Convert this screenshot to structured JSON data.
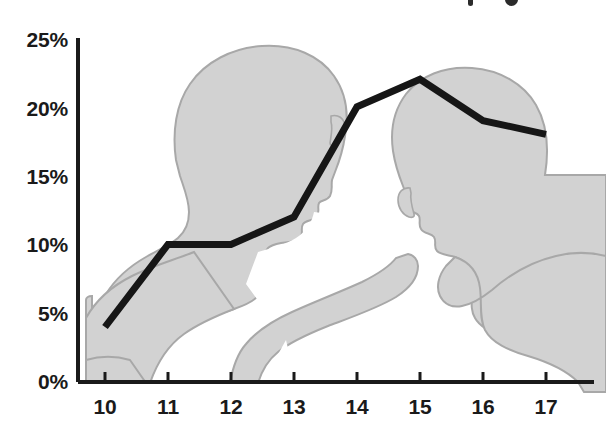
{
  "chart_data": {
    "type": "line",
    "title": "",
    "xlabel": "",
    "ylabel": "",
    "x": [
      10,
      11,
      12,
      13,
      14,
      15,
      16,
      17
    ],
    "categories": [
      "10",
      "11",
      "12",
      "13",
      "14",
      "15",
      "16",
      "17"
    ],
    "values": [
      4,
      10,
      10,
      12,
      20,
      22,
      19,
      18
    ],
    "series": [
      {
        "name": "",
        "values": [
          4,
          10,
          10,
          12,
          20,
          22,
          19,
          18
        ]
      }
    ],
    "ylim": [
      0,
      25
    ],
    "ytick_labels": [
      "0%",
      "5%",
      "10%",
      "15%",
      "20%",
      "25%"
    ],
    "ytick_values": [
      0,
      5,
      10,
      15,
      20,
      25
    ],
    "xtick_labels": [
      "10",
      "11",
      "12",
      "13",
      "14",
      "15",
      "16",
      "17"
    ],
    "grid": false,
    "legend": null,
    "legend_position": "none",
    "value_suffix": "%",
    "annotations": []
  },
  "style": {
    "line_color": "#161616",
    "axis_color": "#1a1a1a",
    "label_color": "#1a1a1a",
    "silhouette_fill": "#d2d2d2",
    "silhouette_stroke": "#a8a8a8",
    "background": "#ffffff"
  },
  "axis": {
    "y_labels": [
      "25%",
      "20%",
      "15%",
      "10%",
      "5%",
      "0%"
    ],
    "x_labels": [
      "10",
      "11",
      "12",
      "13",
      "14",
      "15",
      "16",
      "17"
    ]
  },
  "decor": {
    "left_figure": "person-silhouette-left",
    "right_figure": "person-silhouette-right",
    "title_remnant": "clipped-title-text"
  }
}
